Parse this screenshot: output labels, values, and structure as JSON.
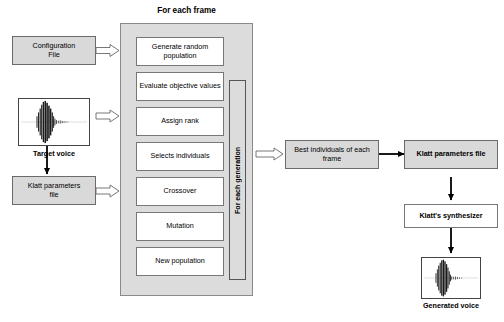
{
  "diagram": {
    "title": "For each frame",
    "generation_label": "For each generation"
  },
  "inputs": [
    {
      "id": "configuration-file",
      "label": "Configuration\nFile"
    },
    {
      "id": "target-voice",
      "label": "Target voice"
    },
    {
      "id": "klatt-parameters-file-input",
      "label": "Klatt parameters\nfile"
    }
  ],
  "process_steps": [
    {
      "id": "generate-random-population",
      "label": "Generate random population"
    },
    {
      "id": "evaluate-objective-values",
      "label": "Evaluate objective values"
    },
    {
      "id": "assign-rank",
      "label": "Assign rank"
    },
    {
      "id": "selects-individuals",
      "label": "Selects individuals"
    },
    {
      "id": "crossover",
      "label": "Crossover"
    },
    {
      "id": "mutation",
      "label": "Mutation"
    },
    {
      "id": "new-population",
      "label": "New population"
    }
  ],
  "outputs": [
    {
      "id": "best-individuals",
      "label": "Best individuals of each frame"
    },
    {
      "id": "klatt-parameters-file-output",
      "label": "Klatt parameters file"
    },
    {
      "id": "klatt-synthesizer",
      "label": "Klatt's synthesizer"
    },
    {
      "id": "generated-voice",
      "label": "Generated voice"
    }
  ],
  "colors": {
    "box_fill_grey": "#d9d9d9",
    "box_fill_white": "#ffffff",
    "container_fill": "#dcdcdc",
    "border": "#6b6b6b",
    "arrow": "#000000"
  }
}
